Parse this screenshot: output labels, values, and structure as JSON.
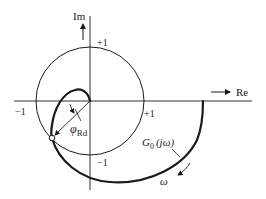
{
  "diagram": {
    "type": "nyquist-plot",
    "axes": {
      "real_label": "Re",
      "imag_label": "Im"
    },
    "unit_circle_ticks": {
      "pos_imag": "+1",
      "neg_imag": "−1",
      "pos_real": "+1",
      "neg_real": "−1"
    },
    "curve_label_main": "G",
    "curve_label_sub": "0",
    "curve_label_arg": "(jω)",
    "direction_label": "ω",
    "phase_margin_label_main": "φ",
    "phase_margin_label_sub": "Rd",
    "colors": {
      "stroke": "#1a1a1a",
      "background": "#ffffff"
    }
  }
}
